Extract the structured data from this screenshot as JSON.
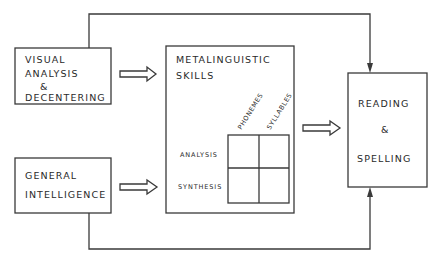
{
  "diagram": {
    "boxes": {
      "visual": {
        "lines": [
          "VISUAL",
          "ANALYSIS",
          "&",
          "DECENTERING"
        ]
      },
      "general": {
        "lines": [
          "GENERAL",
          "INTELLIGENCE"
        ]
      },
      "metalinguistic": {
        "lines": [
          "METALINGUISTIC",
          "SKILLS"
        ],
        "columns": [
          "PHONEMES",
          "SYLLABLES"
        ],
        "rows": [
          "ANALYSIS",
          "SYNTHESIS"
        ]
      },
      "reading": {
        "lines": [
          "READING",
          "&",
          "SPELLING"
        ]
      }
    },
    "colors": {
      "stroke": "#3a3a3a",
      "background": "#ffffff"
    }
  }
}
